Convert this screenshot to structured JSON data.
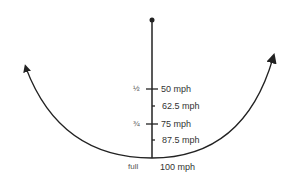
{
  "diagram": {
    "colors": {
      "stroke": "#222222",
      "text": "#333333"
    },
    "pivot": {
      "label": ""
    },
    "scale_labels": [
      {
        "speed": "50 mph",
        "fraction": "½"
      },
      {
        "speed": "62.5 mph",
        "fraction": ""
      },
      {
        "speed": "75 mph",
        "fraction": "¾"
      },
      {
        "speed": "87.5 mph",
        "fraction": ""
      },
      {
        "speed": "100 mph",
        "fraction": "full"
      }
    ],
    "arrows": [
      "left-arrow",
      "right-arrow"
    ]
  }
}
